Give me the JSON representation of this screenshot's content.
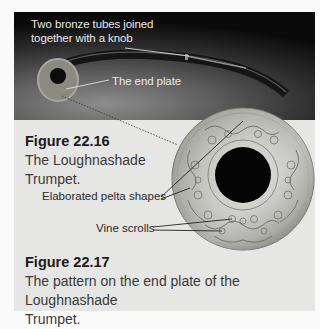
{
  "photo": {
    "labels": {
      "tubes": "Two bronze tubes joined together with a knob",
      "tubes_line1": "Two bronze tubes joined",
      "tubes_line2": "together with a knob",
      "end_plate": "The end plate"
    }
  },
  "figure_22_16": {
    "number": "Figure 22.16",
    "caption_line1": "The Loughnashade",
    "caption_line2": "Trumpet."
  },
  "plate_callouts": {
    "pelta": "Elaborated pelta shapes",
    "vine": "Vine scrolls"
  },
  "figure_22_17": {
    "number": "Figure 22.17",
    "caption_line1": "The pattern on the end plate of the Loughnashade",
    "caption_line2": "Trumpet."
  },
  "colors": {
    "panel_bg": "#e6e6e4",
    "page_bg": "#fafafa",
    "title_text": "#1a1a1a",
    "body_text": "#3a3a3a"
  }
}
